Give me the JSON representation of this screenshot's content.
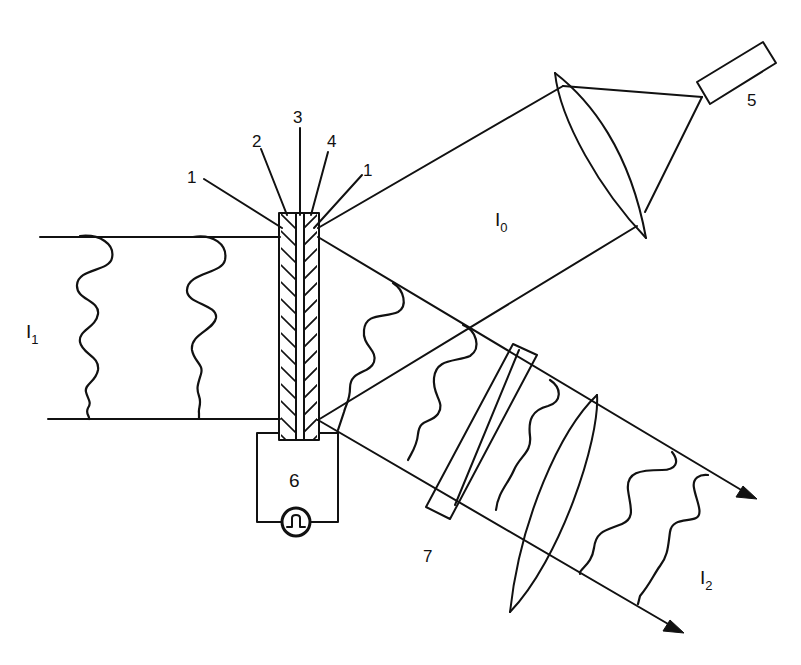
{
  "figure": {
    "type": "optical-setup-schematic",
    "background": "#ffffff",
    "stroke_color": "#111111"
  },
  "labels": {
    "layer_1_left": "1",
    "layer_2": "2",
    "layer_3": "3",
    "layer_4": "4",
    "layer_1_right": "1",
    "laser": "5",
    "circuit_box": "6",
    "element_7": "7",
    "beam_I1": {
      "main": "I",
      "sub": "1"
    },
    "beam_I0": {
      "main": "I",
      "sub": "0"
    },
    "beam_I2": {
      "main": "I",
      "sub": "2"
    }
  },
  "components": [
    {
      "id": "1",
      "name": "outer-layer",
      "description": "outer layers of the cell (both sides)"
    },
    {
      "id": "2",
      "name": "hatched-layer-left"
    },
    {
      "id": "3",
      "name": "center-layer"
    },
    {
      "id": "4",
      "name": "hatched-layer-right"
    },
    {
      "id": "5",
      "name": "light-source"
    },
    {
      "id": "6",
      "name": "drive-circuit-box",
      "extra": "pulse-generator-symbol"
    },
    {
      "id": "7",
      "name": "optical-plate"
    }
  ],
  "beams": [
    {
      "id": "I1",
      "name": "input-beam",
      "direction": "left-to-cell"
    },
    {
      "id": "I0",
      "name": "read-beam",
      "direction": "source-through-lens-to-cell"
    },
    {
      "id": "I2",
      "name": "output-beam",
      "direction": "cell-through-plate-and-lens-to-right"
    }
  ]
}
